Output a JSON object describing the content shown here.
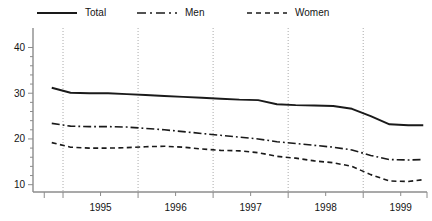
{
  "chart_data": {
    "type": "line",
    "title": "",
    "xlabel": "",
    "ylabel": "",
    "xlim": [
      1994.6,
      1999.85
    ],
    "ylim": [
      8.4,
      41.2
    ],
    "ytick_values": [
      10,
      20,
      30,
      40
    ],
    "ytick_labels": [
      "10",
      "20",
      "30",
      "40"
    ],
    "yminor_step": 2,
    "xtick_labels": [
      "1995",
      "1996",
      "1997",
      "1998",
      "1999"
    ],
    "xtick_centers": [
      1995.5,
      1996.5,
      1997.5,
      1998.5,
      1999.5
    ],
    "gridlines_x": [
      1995.0,
      1996.0,
      1997.0,
      1998.0,
      1999.0
    ],
    "grid": "vertical-dotted",
    "legend_position": "top",
    "series": [
      {
        "name": "Total",
        "style": "solid",
        "color": "#1a1a1a",
        "points": [
          {
            "x": 1994.85,
            "y": 31.2
          },
          {
            "x": 1995.1,
            "y": 30.1
          },
          {
            "x": 1995.35,
            "y": 30.0
          },
          {
            "x": 1995.6,
            "y": 30.0
          },
          {
            "x": 1995.85,
            "y": 29.8
          },
          {
            "x": 1996.1,
            "y": 29.6
          },
          {
            "x": 1996.35,
            "y": 29.4
          },
          {
            "x": 1996.6,
            "y": 29.2
          },
          {
            "x": 1996.85,
            "y": 29.0
          },
          {
            "x": 1997.1,
            "y": 28.8
          },
          {
            "x": 1997.35,
            "y": 28.6
          },
          {
            "x": 1997.6,
            "y": 28.5
          },
          {
            "x": 1997.85,
            "y": 27.6
          },
          {
            "x": 1998.1,
            "y": 27.4
          },
          {
            "x": 1998.35,
            "y": 27.3
          },
          {
            "x": 1998.6,
            "y": 27.2
          },
          {
            "x": 1998.85,
            "y": 26.6
          },
          {
            "x": 1999.1,
            "y": 25.0
          },
          {
            "x": 1999.35,
            "y": 23.2
          },
          {
            "x": 1999.6,
            "y": 23.0
          },
          {
            "x": 1999.8,
            "y": 23.0
          }
        ]
      },
      {
        "name": "Men",
        "style": "dashdot",
        "color": "#1a1a1a",
        "points": [
          {
            "x": 1994.85,
            "y": 23.4
          },
          {
            "x": 1995.1,
            "y": 22.8
          },
          {
            "x": 1995.35,
            "y": 22.7
          },
          {
            "x": 1995.6,
            "y": 22.7
          },
          {
            "x": 1995.85,
            "y": 22.6
          },
          {
            "x": 1996.1,
            "y": 22.3
          },
          {
            "x": 1996.35,
            "y": 22.0
          },
          {
            "x": 1996.6,
            "y": 21.6
          },
          {
            "x": 1996.85,
            "y": 21.2
          },
          {
            "x": 1997.1,
            "y": 20.8
          },
          {
            "x": 1997.35,
            "y": 20.4
          },
          {
            "x": 1997.6,
            "y": 20.0
          },
          {
            "x": 1997.85,
            "y": 19.4
          },
          {
            "x": 1998.1,
            "y": 19.0
          },
          {
            "x": 1998.35,
            "y": 18.6
          },
          {
            "x": 1998.6,
            "y": 18.2
          },
          {
            "x": 1998.85,
            "y": 17.6
          },
          {
            "x": 1999.1,
            "y": 16.4
          },
          {
            "x": 1999.35,
            "y": 15.5
          },
          {
            "x": 1999.6,
            "y": 15.4
          },
          {
            "x": 1999.8,
            "y": 15.5
          }
        ]
      },
      {
        "name": "Women",
        "style": "dashed",
        "color": "#1a1a1a",
        "points": [
          {
            "x": 1994.85,
            "y": 19.2
          },
          {
            "x": 1995.1,
            "y": 18.2
          },
          {
            "x": 1995.35,
            "y": 18.0
          },
          {
            "x": 1995.6,
            "y": 18.0
          },
          {
            "x": 1995.85,
            "y": 18.1
          },
          {
            "x": 1996.1,
            "y": 18.3
          },
          {
            "x": 1996.35,
            "y": 18.4
          },
          {
            "x": 1996.6,
            "y": 18.2
          },
          {
            "x": 1996.85,
            "y": 17.8
          },
          {
            "x": 1997.1,
            "y": 17.5
          },
          {
            "x": 1997.35,
            "y": 17.4
          },
          {
            "x": 1997.6,
            "y": 17.0
          },
          {
            "x": 1997.85,
            "y": 16.2
          },
          {
            "x": 1998.1,
            "y": 15.8
          },
          {
            "x": 1998.35,
            "y": 15.2
          },
          {
            "x": 1998.6,
            "y": 14.8
          },
          {
            "x": 1998.85,
            "y": 14.0
          },
          {
            "x": 1999.1,
            "y": 12.2
          },
          {
            "x": 1999.35,
            "y": 10.8
          },
          {
            "x": 1999.6,
            "y": 10.7
          },
          {
            "x": 1999.8,
            "y": 11.1
          }
        ]
      }
    ]
  },
  "legend": {
    "items": [
      {
        "label": "Total",
        "icon": "solid-line-swatch"
      },
      {
        "label": "Men",
        "icon": "dashdot-line-swatch"
      },
      {
        "label": "Women",
        "icon": "dashed-line-swatch"
      }
    ]
  },
  "axis": {
    "color": "#8c8c8c",
    "gridline_color": "#aaaaaa"
  }
}
